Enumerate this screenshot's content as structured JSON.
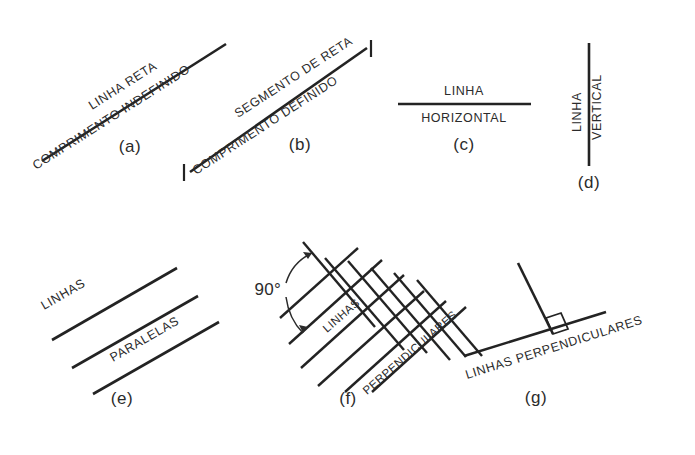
{
  "page": {
    "background_color": "#ffffff",
    "ink_color": "#232323"
  },
  "figures": [
    {
      "key": "a",
      "caption": "(a)",
      "label_above": "LINHA RETA",
      "label_below": "COMPRIMENTO INDEFINIDO",
      "kind": "straight-line-indefinite"
    },
    {
      "key": "b",
      "caption": "(b)",
      "label_above": "SEGMENTO DE RETA",
      "label_below": "COMPRIMENTO DEFINIDO",
      "kind": "line-segment-defined"
    },
    {
      "key": "c",
      "caption": "(c)",
      "label_above": "LINHA",
      "label_below": "HORIZONTAL",
      "kind": "horizontal-line"
    },
    {
      "key": "d",
      "caption": "(d)",
      "label_left": "LINHA",
      "label_right": "VERTICAL",
      "kind": "vertical-line"
    },
    {
      "key": "e",
      "caption": "(e)",
      "label_above": "LINHAS",
      "label_below": "PARALELAS",
      "kind": "parallel-lines",
      "line_count": 3
    },
    {
      "key": "f",
      "caption": "(f)",
      "label_above": "LINHAS",
      "label_below": "PERPENDICULARES",
      "angle_label": "90°",
      "kind": "perpendicular-grid"
    },
    {
      "key": "g",
      "caption": "(g)",
      "label_below": "LINHAS PERPENDICULARES",
      "kind": "perpendicular-pair-right-angle"
    }
  ]
}
